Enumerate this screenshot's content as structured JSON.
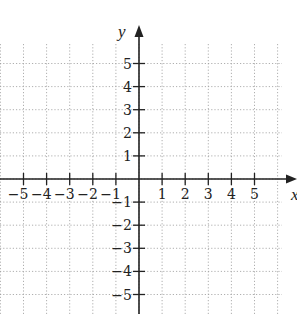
{
  "chart_data": {
    "type": "scatter",
    "title": "",
    "xlabel": "x",
    "ylabel": "y",
    "xlim": [
      -6,
      6
    ],
    "ylim": [
      -6,
      6
    ],
    "grid": true,
    "grid_style": "dotted",
    "x_ticks": [
      -5,
      -4,
      -3,
      -2,
      -1,
      1,
      2,
      3,
      4,
      5
    ],
    "y_ticks": [
      -5,
      -4,
      -3,
      -2,
      -1,
      1,
      2,
      3,
      4,
      5
    ],
    "x_tick_labels": [
      "−5",
      "−4",
      "−3",
      "−2",
      "−1",
      "1",
      "2",
      "3",
      "4",
      "5"
    ],
    "y_tick_labels": [
      "−5",
      "−4",
      "−3",
      "−2",
      "−1",
      "1",
      "2",
      "3",
      "4",
      "5"
    ],
    "series": [],
    "points": []
  },
  "axes": {
    "x_label": "x",
    "y_label": "y"
  },
  "colors": {
    "axis": "#222222",
    "grid": "#9a9a9a",
    "background": "#ffffff"
  }
}
